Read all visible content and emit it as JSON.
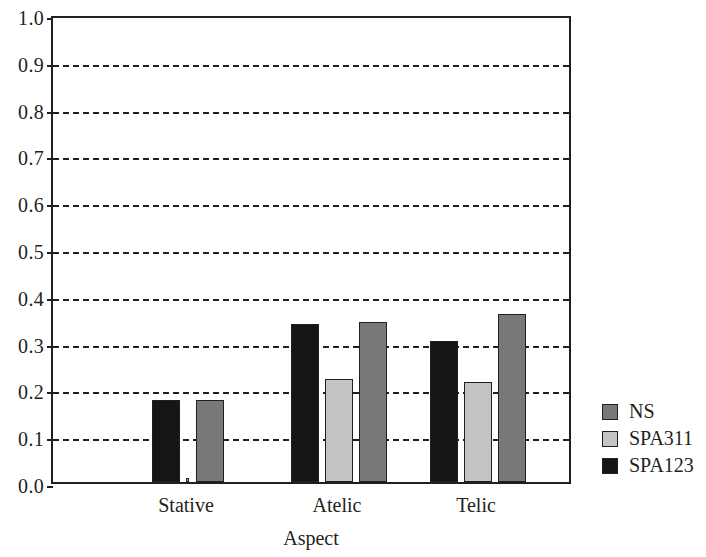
{
  "chart_data": {
    "type": "bar",
    "title": "",
    "subtitle": "",
    "xlabel": "Aspect",
    "ylabel": "",
    "categories": [
      "Stative",
      "Atelic",
      "Telic"
    ],
    "series": [
      {
        "name": "SPA123",
        "color": "#151515",
        "values": [
          0.176,
          0.337,
          0.302
        ]
      },
      {
        "name": "SPA311",
        "color": "#c4c4c4",
        "values": [
          0.008,
          0.221,
          0.213
        ]
      },
      {
        "name": "NS",
        "color": "#787878",
        "values": [
          0.176,
          0.342,
          0.358
        ]
      }
    ],
    "ylim": [
      0.0,
      1.0
    ],
    "ytick_labels": [
      "1.0",
      "0.9",
      "0.8",
      "0.7",
      "0.6",
      "0.5",
      "0.4",
      "0.3",
      "0.2",
      "0.1",
      "0.0"
    ],
    "ytick_values": [
      1.0,
      0.9,
      0.8,
      0.7,
      0.6,
      0.5,
      0.4,
      0.3,
      0.2,
      0.1,
      0.0
    ],
    "grid": true,
    "grid_style": "dashed",
    "grid_axis": "y",
    "legend_position": "right",
    "legend": [
      {
        "label": "NS",
        "color": "#787878"
      },
      {
        "label": "SPA311",
        "color": "#c4c4c4"
      },
      {
        "label": "SPA123",
        "color": "#151515"
      }
    ]
  },
  "colors": {
    "ns": "#787878",
    "spa311": "#c4c4c4",
    "spa123": "#151515",
    "axis": "#231f20",
    "background": "#ffffff"
  }
}
